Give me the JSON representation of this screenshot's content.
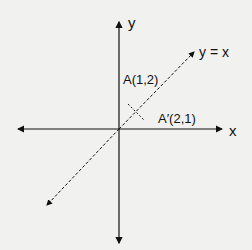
{
  "diagram": {
    "axis_labels": {
      "x": "x",
      "y": "y"
    },
    "line_label": "y = x",
    "point_a": "A(1,2)",
    "point_a_prime": "A′(2,1)",
    "colors": {
      "background": "#f1f1ef",
      "ink": "#111111"
    }
  }
}
